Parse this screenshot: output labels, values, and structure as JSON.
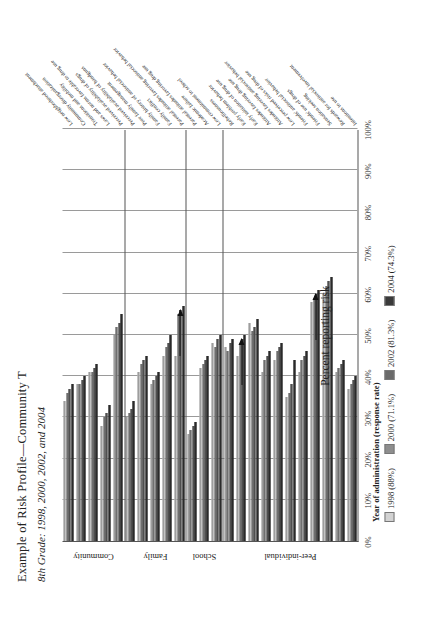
{
  "title": "Example of Risk Profile—Community T",
  "subtitle": "8th Grade: 1998, 2000, 2002, and 2004",
  "legend": {
    "title": "Year of administration (response rate)",
    "items": [
      {
        "label": "1998 (88%)",
        "color": "#d2d2d2"
      },
      {
        "label": "2000 (71.1%)",
        "color": "#8e8e8e"
      },
      {
        "label": "2002 (81.3%)",
        "color": "#6a6a6a"
      },
      {
        "label": "2004 (74.3%)",
        "color": "#3a3a3a"
      }
    ]
  },
  "axis": {
    "ylabel": "Percent reporting risk",
    "ticks": [
      "0%",
      "10%",
      "20%",
      "30%",
      "40%",
      "50%",
      "60%",
      "70%",
      "80%",
      "90%",
      "100%"
    ]
  },
  "domains": [
    {
      "name": "Community",
      "start": 0,
      "count": 5
    },
    {
      "name": "Family",
      "start": 5,
      "count": 5
    },
    {
      "name": "School",
      "start": 10,
      "count": 3
    },
    {
      "name": "Peer-individual",
      "start": 13,
      "count": 11
    }
  ],
  "chart_data": {
    "type": "bar",
    "title": "Example of Risk Profile—Community T",
    "subtitle": "8th Grade: 1998, 2000, 2002, and 2004",
    "orientation": "horizontal",
    "xlabel": "Percent reporting risk",
    "ylabel": "",
    "xlim": [
      0,
      100
    ],
    "grid": true,
    "legend_position": "bottom",
    "categories": [
      "Low neighborhood attachment",
      "Community disorganization",
      "Transitions and mobility",
      "Laws and norms favorable to drug use",
      "Perceived availability of drugs",
      "Perceived availability of handguns",
      "Poor family management",
      "Family history of antisocial behavior",
      "Family conflict",
      "Parental attitudes favoring antisocial behavior",
      "Parental attitudes favoring drug use",
      "Academic failure",
      "Low commitment to school",
      "Rebelliousness",
      "Early problem behavior",
      "Early initiation of drug use",
      "Attitudes favoring drug use",
      "Attitudes favoring antisocial behavior",
      "Low perceived risks of drug use",
      "Friends' antisocial behavior",
      "Friends' use of drugs",
      "Sensation seeking",
      "Rewards for antisocial involvement",
      "Intentions to use"
    ],
    "series": [
      {
        "name": "1998 (88%)",
        "color": "#d2d2d2",
        "values": [
          34,
          38,
          41,
          28,
          50,
          30,
          41,
          38,
          45,
          45,
          26,
          42,
          48,
          47,
          45,
          53,
          41,
          44,
          35,
          41,
          58,
          60,
          41,
          37
        ]
      },
      {
        "name": "2000 (71.1%)",
        "color": "#8e8e8e",
        "values": [
          36,
          38,
          41,
          30,
          52,
          31,
          43,
          39,
          47,
          55,
          27,
          43,
          47,
          46,
          48,
          51,
          44,
          46,
          36,
          44,
          59,
          62,
          42,
          38
        ]
      },
      {
        "name": "2002 (81.3%)",
        "color": "#6a6a6a",
        "values": [
          37,
          39,
          42,
          31,
          53,
          32,
          44,
          40,
          48,
          56,
          28,
          44,
          49,
          48,
          49,
          52,
          45,
          47,
          38,
          45,
          60,
          63,
          43,
          39
        ]
      },
      {
        "name": "2004 (74.3%)",
        "color": "#3a3a3a",
        "values": [
          38,
          40,
          43,
          33,
          55,
          34,
          45,
          41,
          50,
          57,
          29,
          45,
          50,
          49,
          50,
          54,
          46,
          48,
          44,
          46,
          61,
          64,
          44,
          40
        ]
      }
    ]
  },
  "callouts": [
    {
      "target_category": "Parental attitudes favoring antisocial behavior"
    },
    {
      "target_category": "Early problem behavior"
    },
    {
      "target_category": "Friends' use of drugs"
    }
  ]
}
